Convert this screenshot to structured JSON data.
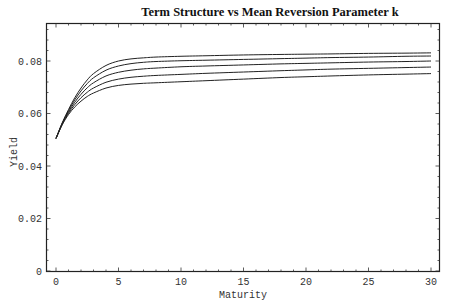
{
  "chart_data": {
    "type": "line",
    "title": "Term Structure vs  Mean Reversion Parameter k",
    "xlabel": "Maturity",
    "ylabel": "Yield",
    "xlim": [
      -0.8,
      30.8
    ],
    "ylim": [
      0,
      0.096
    ],
    "x_ticks": [
      0,
      5,
      10,
      15,
      20,
      25,
      30
    ],
    "x_tick_labels": [
      "0",
      "5",
      "10",
      "15",
      "20",
      "25",
      "30"
    ],
    "y_ticks": [
      0,
      0.02,
      0.04,
      0.06,
      0.08
    ],
    "y_tick_labels": [
      "0",
      "0.02",
      "0.04",
      "0.06",
      "0.08"
    ],
    "grid": false,
    "legend": null,
    "x": [
      0,
      0.5,
      1,
      1.5,
      2,
      2.5,
      3,
      4,
      5,
      6,
      7,
      8,
      10,
      12,
      15,
      18,
      20,
      22,
      25,
      28,
      30
    ],
    "series": [
      {
        "name": "curve 1",
        "values": [
          0.0505,
          0.0565,
          0.0615,
          0.066,
          0.0697,
          0.0728,
          0.0752,
          0.0783,
          0.08,
          0.0808,
          0.0812,
          0.0815,
          0.0818,
          0.082,
          0.0823,
          0.0825,
          0.0826,
          0.0827,
          0.0829,
          0.083,
          0.0831
        ]
      },
      {
        "name": "curve 2",
        "values": [
          0.0505,
          0.0563,
          0.0611,
          0.0652,
          0.0686,
          0.0714,
          0.0736,
          0.0765,
          0.0781,
          0.079,
          0.0795,
          0.0798,
          0.0801,
          0.0803,
          0.0806,
          0.0809,
          0.0811,
          0.0813,
          0.0815,
          0.0818,
          0.0819
        ]
      },
      {
        "name": "curve 3",
        "values": [
          0.0505,
          0.0561,
          0.0606,
          0.0643,
          0.0673,
          0.0698,
          0.0717,
          0.0743,
          0.0757,
          0.0765,
          0.077,
          0.0773,
          0.0778,
          0.0781,
          0.0785,
          0.0789,
          0.0791,
          0.0793,
          0.0796,
          0.0798,
          0.08
        ]
      },
      {
        "name": "curve 4",
        "values": [
          0.0505,
          0.0559,
          0.0601,
          0.0634,
          0.066,
          0.0681,
          0.0697,
          0.0719,
          0.0731,
          0.0738,
          0.0742,
          0.0745,
          0.0749,
          0.0753,
          0.0758,
          0.0763,
          0.0766,
          0.0769,
          0.0772,
          0.0775,
          0.0777
        ]
      },
      {
        "name": "curve 5",
        "values": [
          0.0505,
          0.0557,
          0.0596,
          0.0625,
          0.0647,
          0.0665,
          0.0678,
          0.0697,
          0.0707,
          0.0712,
          0.0715,
          0.0717,
          0.0721,
          0.0725,
          0.0731,
          0.0737,
          0.074,
          0.0743,
          0.0747,
          0.075,
          0.0752
        ]
      }
    ]
  }
}
